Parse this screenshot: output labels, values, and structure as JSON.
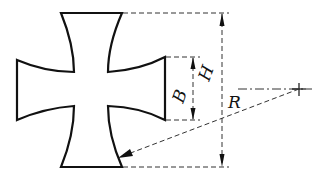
{
  "diagram": {
    "shape": "cross-pattee",
    "labels": {
      "height": "H",
      "arm_width": "B",
      "radius": "R"
    },
    "colors": {
      "stroke": "#111111",
      "dash": "#333333",
      "background": "#ffffff"
    }
  }
}
